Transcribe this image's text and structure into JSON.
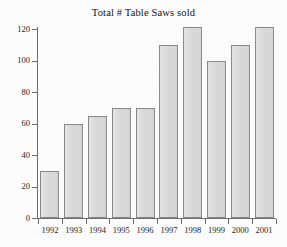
{
  "chart_data": {
    "type": "bar",
    "title": "Total # Table Saws sold",
    "xlabel": "",
    "ylabel": "",
    "categories": [
      "1992",
      "1993",
      "1994",
      "1995",
      "1996",
      "1997",
      "1998",
      "1999",
      "2000",
      "2001"
    ],
    "values": [
      30,
      60,
      65,
      70,
      70,
      110,
      121,
      100,
      110,
      121
    ],
    "ylim": [
      0,
      120
    ],
    "ytick_labels": [
      "0",
      "20",
      "40",
      "60",
      "80",
      "100",
      "120"
    ],
    "ytick_values": [
      0,
      20,
      40,
      60,
      80,
      100,
      120
    ],
    "ytick_interval": 20,
    "grid": false,
    "legend": false,
    "legend_position": "none",
    "bar_fill_color": "#dcdcdc",
    "bar_border_color": "#8a8a8a",
    "axis_color": "#6e6e6e",
    "background_color": "#fdfdfd",
    "text_color": "#1a1a1a"
  }
}
